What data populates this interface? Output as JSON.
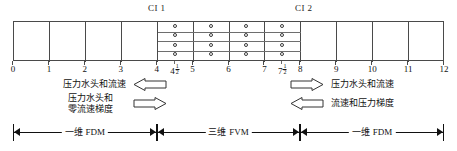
{
  "figure": {
    "interface_labels": [
      {
        "id": "CI1",
        "text": "CI 1",
        "x": 4.5
      },
      {
        "id": "CI2",
        "text": "CI 2",
        "x": 7.5
      }
    ],
    "axis": {
      "min": 0,
      "max": 12,
      "major_ticks": [
        "0",
        "1",
        "2",
        "3",
        "4",
        "5",
        "6",
        "7",
        "8",
        "9",
        "10",
        "11",
        "12"
      ],
      "half_ticks": [
        {
          "label": "4",
          "fraction_num": "1",
          "fraction_den": "2",
          "value": 4.5
        },
        {
          "label": "7",
          "fraction_num": "1",
          "fraction_den": "2",
          "value": 7.5
        }
      ]
    },
    "grid": {
      "columns_total": 12,
      "fine_region": {
        "start": 4,
        "end": 8,
        "cols": 4,
        "rows": 4
      },
      "node_marker": "circle"
    },
    "annotations": [
      {
        "id": "left-top",
        "text": "压力水头和流速",
        "arrow": "left-arrow-outline",
        "arrow_direction": "left"
      },
      {
        "id": "left-bottom",
        "line1": "压力水头和",
        "line2": "零流速梯度",
        "arrow": "right-arrow-outline",
        "arrow_direction": "right"
      },
      {
        "id": "right-top",
        "text": "压力水头和流速",
        "arrow": "right-arrow-outline",
        "arrow_direction": "right"
      },
      {
        "id": "right-bottom",
        "text": "流速和压力梯度",
        "arrow": "left-arrow-outline",
        "arrow_direction": "left"
      }
    ],
    "brackets": [
      {
        "id": "left",
        "label": "一维 FDM",
        "from": 0,
        "to": 4
      },
      {
        "id": "middle",
        "label": "三维 FVM",
        "from": 4,
        "to": 8
      },
      {
        "id": "right",
        "label": "一维 FDM",
        "from": 8,
        "to": 12
      }
    ],
    "colors": {
      "stroke": "#4a4a4a",
      "fine_stroke": "#6e6e6e",
      "text": "#111111",
      "background": "#ffffff"
    }
  }
}
